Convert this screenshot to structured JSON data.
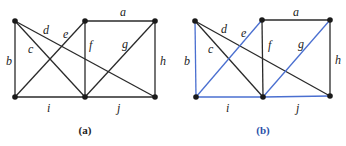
{
  "graphs": [
    {
      "caption": "(a)",
      "caption_color": "#222222",
      "vertices": {
        "TL": [
          15,
          21
        ],
        "TM": [
          85,
          21
        ],
        "TR": [
          155,
          21
        ],
        "BL": [
          15,
          97
        ],
        "BM": [
          85,
          97
        ],
        "BR": [
          155,
          97
        ]
      },
      "edges": [
        {
          "label": "a",
          "from": "TM",
          "to": "TR",
          "color": "#2a2a2a",
          "lx": 120,
          "ly": 16
        },
        {
          "label": "b",
          "from": "TL",
          "to": "BL",
          "color": "#2a2a2a",
          "lx": 6,
          "ly": 65
        },
        {
          "label": "c",
          "from": "TL",
          "to": "BM",
          "color": "#2a2a2a",
          "lx": 28,
          "ly": 53
        },
        {
          "label": "d",
          "from": "TL",
          "to": "BR",
          "color": "#2a2a2a",
          "lx": 43,
          "ly": 34
        },
        {
          "label": "e",
          "from": "BL",
          "to": "TM",
          "color": "#2a2a2a",
          "lx": 63,
          "ly": 38
        },
        {
          "label": "f",
          "from": "TM",
          "to": "BM",
          "color": "#2a2a2a",
          "lx": 89,
          "ly": 49
        },
        {
          "label": "g",
          "from": "BM",
          "to": "TR",
          "color": "#2a2a2a",
          "lx": 122,
          "ly": 48
        },
        {
          "label": "h",
          "from": "TR",
          "to": "BR",
          "color": "#2a2a2a",
          "lx": 160,
          "ly": 65
        },
        {
          "label": "i",
          "from": "BL",
          "to": "BM",
          "color": "#2a2a2a",
          "lx": 47,
          "ly": 112
        },
        {
          "label": "j",
          "from": "BM",
          "to": "BR",
          "color": "#2a2a2a",
          "lx": 117,
          "ly": 112
        }
      ]
    },
    {
      "caption": "(b)",
      "caption_color": "#2b4fa8",
      "vertices": {
        "TL": [
          195,
          21
        ],
        "TM": [
          262,
          20
        ],
        "TR": [
          330,
          20
        ],
        "BL": [
          196,
          97
        ],
        "BM": [
          263,
          97
        ],
        "BR": [
          330,
          96
        ]
      },
      "edges": [
        {
          "label": "a",
          "from": "TM",
          "to": "TR",
          "color": "#2a2a2a",
          "lx": 293,
          "ly": 16
        },
        {
          "label": "b",
          "from": "TL",
          "to": "BL",
          "color": "#4a6fd0",
          "lx": 184,
          "ly": 65
        },
        {
          "label": "c",
          "from": "TL",
          "to": "BM",
          "color": "#2a2a2a",
          "lx": 208,
          "ly": 53
        },
        {
          "label": "d",
          "from": "TL",
          "to": "BR",
          "color": "#2a2a2a",
          "lx": 221,
          "ly": 33
        },
        {
          "label": "e",
          "from": "BL",
          "to": "TM",
          "color": "#4a6fd0",
          "lx": 241,
          "ly": 37
        },
        {
          "label": "f",
          "from": "TM",
          "to": "BM",
          "color": "#2a2a2a",
          "lx": 268,
          "ly": 49
        },
        {
          "label": "g",
          "from": "BM",
          "to": "TR",
          "color": "#4a6fd0",
          "lx": 298,
          "ly": 48
        },
        {
          "label": "h",
          "from": "TR",
          "to": "BR",
          "color": "#2a2a2a",
          "lx": 335,
          "ly": 64
        },
        {
          "label": "i",
          "from": "BL",
          "to": "BM",
          "color": "#4a6fd0",
          "lx": 226,
          "ly": 112
        },
        {
          "label": "j",
          "from": "BM",
          "to": "BR",
          "color": "#4a6fd0",
          "lx": 296,
          "ly": 112
        }
      ]
    }
  ],
  "captions": [
    "(a)",
    "(b)"
  ]
}
